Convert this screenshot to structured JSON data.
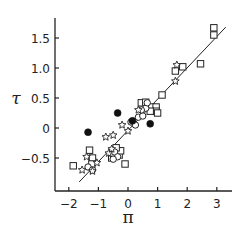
{
  "chart_data": {
    "type": "scatter",
    "title": "",
    "xlabel": "π",
    "ylabel": "τ",
    "xlim": [
      -2.5,
      3.5
    ],
    "ylim": [
      -0.95,
      1.95
    ],
    "xticks": [
      -2,
      -1,
      0,
      1,
      2,
      3
    ],
    "xtick_labels": [
      "−2",
      "−1",
      "0",
      "1",
      "2",
      "3"
    ],
    "yticks": [
      -0.5,
      0,
      0.5,
      1.0,
      1.5
    ],
    "ytick_labels": [
      "−0.5",
      "0",
      "0.5",
      "1.0",
      "1.5"
    ],
    "grid": false,
    "legend": null,
    "series": [
      {
        "name": "open squares",
        "marker": "square-open",
        "points": [
          [
            -1.85,
            -0.63
          ],
          [
            -1.3,
            -0.37
          ],
          [
            -1.2,
            -0.5
          ],
          [
            -1.22,
            -0.6
          ],
          [
            -0.55,
            -0.5
          ],
          [
            -0.5,
            -0.42
          ],
          [
            -0.35,
            -0.38
          ],
          [
            -0.3,
            -0.45
          ],
          [
            -0.25,
            -0.38
          ],
          [
            -0.4,
            -0.33
          ],
          [
            -0.1,
            -0.6
          ],
          [
            0.45,
            0.42
          ],
          [
            0.6,
            0.43
          ],
          [
            0.8,
            0.35
          ],
          [
            0.95,
            0.35
          ],
          [
            0.95,
            0.28
          ],
          [
            0.75,
            0.28
          ],
          [
            1.0,
            0.25
          ],
          [
            1.15,
            0.55
          ],
          [
            1.6,
            0.95
          ],
          [
            1.85,
            1.02
          ],
          [
            2.45,
            1.07
          ],
          [
            2.9,
            1.55
          ],
          [
            2.9,
            1.67
          ]
        ]
      },
      {
        "name": "open circles",
        "marker": "circle-open",
        "points": [
          [
            -1.35,
            -0.65
          ],
          [
            -1.2,
            -0.7
          ],
          [
            -0.45,
            -0.4
          ],
          [
            -0.35,
            -0.48
          ],
          [
            -0.5,
            -0.52
          ],
          [
            0.1,
            0.1
          ],
          [
            0.25,
            0.05
          ],
          [
            0.35,
            0.18
          ],
          [
            0.5,
            0.2
          ],
          [
            0.6,
            0.33
          ],
          [
            0.65,
            0.42
          ],
          [
            0.45,
            0.3
          ]
        ]
      },
      {
        "name": "stars",
        "marker": "star-open",
        "points": [
          [
            -1.4,
            -0.48
          ],
          [
            -1.55,
            -0.7
          ],
          [
            -1.2,
            -0.72
          ],
          [
            -1.05,
            -0.58
          ],
          [
            -0.65,
            -0.42
          ],
          [
            -0.55,
            -0.35
          ],
          [
            -0.75,
            -0.15
          ],
          [
            -0.5,
            -0.12
          ],
          [
            -0.2,
            0.05
          ],
          [
            0.0,
            -0.05
          ],
          [
            0.35,
            0.3
          ],
          [
            1.6,
            0.78
          ],
          [
            1.65,
            1.05
          ]
        ]
      },
      {
        "name": "filled circles",
        "marker": "circle-filled",
        "points": [
          [
            -1.35,
            -0.07
          ],
          [
            -0.35,
            0.25
          ],
          [
            0.15,
            0.12
          ],
          [
            0.75,
            0.07
          ]
        ]
      }
    ],
    "annotations": [
      {
        "type": "regression-line",
        "from": [
          -1.65,
          -0.9
        ],
        "to": [
          3.3,
          1.68
        ]
      }
    ]
  }
}
